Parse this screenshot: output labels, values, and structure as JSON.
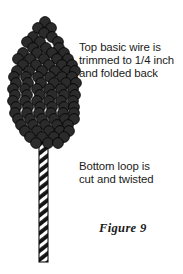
{
  "figure": {
    "caption": "Figure 9",
    "background_color": "#ffffff",
    "text_color": "#1b1b1b"
  },
  "callouts": [
    {
      "id": "top-wire-note",
      "text": "Top basic wire is\ntrimmed to 1/4 inch\nand folded back"
    },
    {
      "id": "bottom-loop-note",
      "text": "Bottom loop is\ncut and twisted"
    }
  ],
  "illustration": {
    "name": "beaded-flower-cluster-with-twisted-wire-stem",
    "bead_color": "#2b2b2b",
    "bead_outline_color": "#000000",
    "stem_color": "#1a1a1a",
    "stem_highlight_color": "#ffffff",
    "bead_radius": 5.4,
    "stem": {
      "x_left": 39,
      "x_right": 48,
      "y_top": 140,
      "y_bottom": 262,
      "hatch_angle_deg": 52
    },
    "bead_rows": [
      {
        "y": 22,
        "xs": [
          45
        ]
      },
      {
        "y": 28,
        "xs": [
          38,
          51
        ]
      },
      {
        "y": 33,
        "xs": [
          44
        ]
      },
      {
        "y": 37,
        "xs": [
          33,
          52
        ]
      },
      {
        "y": 42,
        "xs": [
          27,
          40,
          58
        ]
      },
      {
        "y": 48,
        "xs": [
          33,
          46,
          59
        ]
      },
      {
        "y": 53,
        "xs": [
          23,
          37,
          52,
          64
        ]
      },
      {
        "y": 59,
        "xs": [
          18,
          30,
          44,
          57,
          68
        ]
      },
      {
        "y": 65,
        "xs": [
          23,
          36,
          49,
          62,
          72
        ]
      },
      {
        "y": 71,
        "xs": [
          17,
          29,
          42,
          55,
          67,
          75
        ]
      },
      {
        "y": 77,
        "xs": [
          14,
          26,
          38,
          50,
          62,
          72
        ]
      },
      {
        "y": 83,
        "xs": [
          16,
          28,
          41,
          54,
          66,
          76
        ]
      },
      {
        "y": 89,
        "xs": [
          13,
          25,
          37,
          49,
          61,
          73
        ]
      },
      {
        "y": 95,
        "xs": [
          15,
          27,
          40,
          52,
          64,
          75
        ]
      },
      {
        "y": 101,
        "xs": [
          13,
          25,
          37,
          49,
          61,
          73
        ]
      },
      {
        "y": 107,
        "xs": [
          16,
          28,
          40,
          52,
          64,
          74
        ]
      },
      {
        "y": 113,
        "xs": [
          15,
          27,
          39,
          51,
          63,
          74
        ]
      },
      {
        "y": 119,
        "xs": [
          18,
          30,
          42,
          54,
          65,
          74
        ]
      },
      {
        "y": 125,
        "xs": [
          21,
          33,
          45,
          57,
          68
        ]
      },
      {
        "y": 131,
        "xs": [
          25,
          37,
          49,
          60,
          69
        ]
      },
      {
        "y": 137,
        "xs": [
          30,
          42,
          54,
          64
        ]
      },
      {
        "y": 143,
        "xs": [
          36,
          48,
          58
        ]
      }
    ]
  }
}
